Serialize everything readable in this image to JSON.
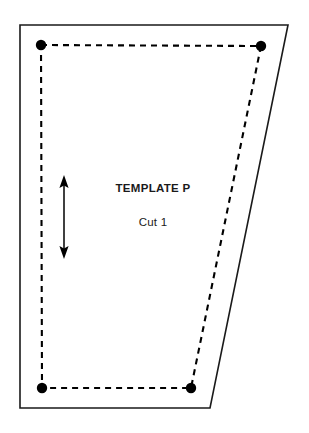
{
  "document": {
    "kind": "sewing-pattern-piece",
    "background_color": "#ffffff"
  },
  "pattern": {
    "title": "TEMPLATE P",
    "cut_instruction": "Cut 1",
    "line_color": "#1a1a1a",
    "dot_color": "#000000",
    "cutting_line": {
      "name": "cutting-line",
      "style": "solid",
      "points": "20,25 288,25 210,408 20,408"
    },
    "seam_line": {
      "name": "seam-line",
      "style": "dashed",
      "points": "41,45 261,46 191,388 42,388",
      "dash_pattern": "6,5"
    },
    "corner_dots": [
      {
        "name": "corner-dot-top-left",
        "cx": 41,
        "cy": 45,
        "r": 5.2
      },
      {
        "name": "corner-dot-top-right",
        "cx": 261,
        "cy": 46,
        "r": 5.2
      },
      {
        "name": "corner-dot-bottom-right",
        "cx": 191,
        "cy": 388,
        "r": 5.2
      },
      {
        "name": "corner-dot-bottom-left",
        "cx": 42,
        "cy": 388,
        "r": 5.2
      }
    ],
    "grainline": {
      "name": "grainline-arrow",
      "orientation": "vertical",
      "double_headed": true,
      "x": 64,
      "y_top": 176,
      "y_bottom": 258
    }
  }
}
